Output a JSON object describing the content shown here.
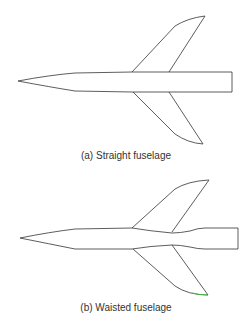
{
  "figures": [
    {
      "id": "a",
      "caption": "(a) Straight fuselage"
    },
    {
      "id": "b",
      "caption": "(b) Waisted fuselage"
    }
  ],
  "colors": {
    "stroke": "#333333",
    "background": "#ffffff",
    "accent": "#33cc33"
  }
}
